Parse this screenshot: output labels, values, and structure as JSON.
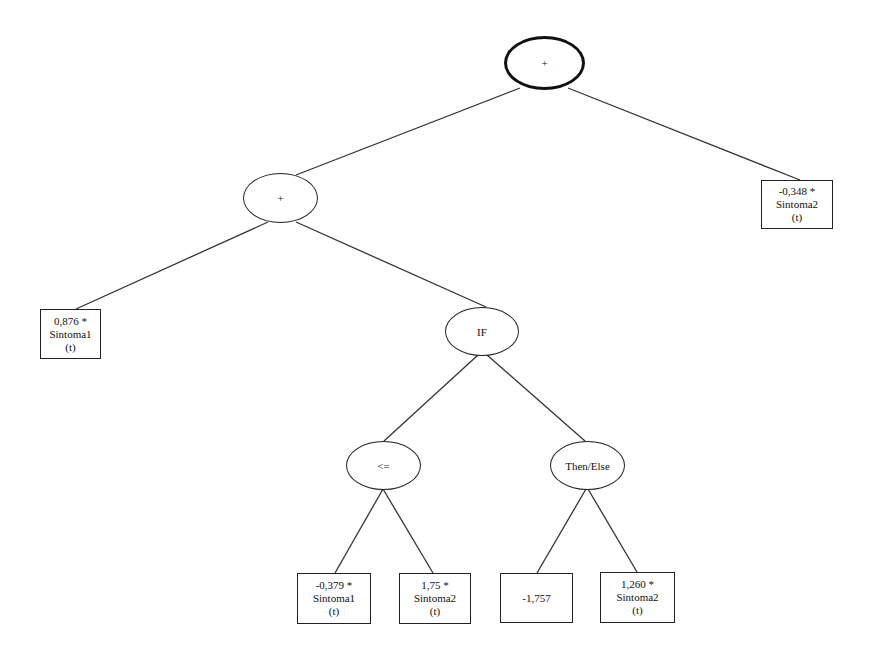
{
  "diagram": {
    "type": "expression-tree",
    "nodes": {
      "root": {
        "shape": "ellipse",
        "label": "+"
      },
      "plus": {
        "shape": "ellipse",
        "label": "+"
      },
      "right_leaf": {
        "shape": "box",
        "lines": [
          "-0,348 *",
          "Sintoma2",
          "(t)"
        ]
      },
      "left_leaf": {
        "shape": "box",
        "lines": [
          "0,876 *",
          "Sintoma1",
          "(t)"
        ]
      },
      "if": {
        "shape": "ellipse",
        "label": "IF"
      },
      "le": {
        "shape": "ellipse",
        "label": "<="
      },
      "then_else": {
        "shape": "ellipse",
        "label": "Then/Else"
      },
      "leaf_a": {
        "shape": "box",
        "lines": [
          "-0,379 *",
          "Sintoma1",
          "(t)"
        ]
      },
      "leaf_b": {
        "shape": "box",
        "lines": [
          "1,75 *",
          "Sintoma2",
          "(t)"
        ]
      },
      "leaf_c": {
        "shape": "box",
        "lines": [
          "-1,757"
        ]
      },
      "leaf_d": {
        "shape": "box",
        "lines": [
          "1,260 *",
          "Sintoma2",
          "(t)"
        ]
      }
    },
    "edges": [
      [
        "root",
        "plus"
      ],
      [
        "root",
        "right_leaf"
      ],
      [
        "plus",
        "left_leaf"
      ],
      [
        "plus",
        "if"
      ],
      [
        "if",
        "le"
      ],
      [
        "if",
        "then_else"
      ],
      [
        "le",
        "leaf_a"
      ],
      [
        "le",
        "leaf_b"
      ],
      [
        "then_else",
        "leaf_c"
      ],
      [
        "then_else",
        "leaf_d"
      ]
    ]
  }
}
